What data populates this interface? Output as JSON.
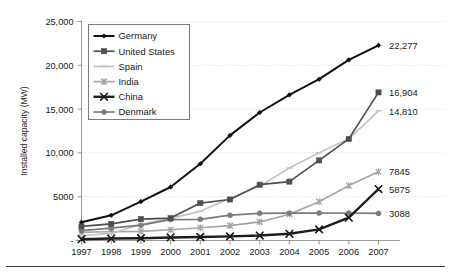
{
  "chart_data": {
    "type": "line",
    "title": "",
    "xlabel": "",
    "ylabel": "Installed capacity (MW)",
    "x": [
      1997,
      1998,
      1999,
      2000,
      2001,
      2002,
      2003,
      2004,
      2005,
      2006,
      2007
    ],
    "categories": [
      "1997",
      "1998",
      "1999",
      "2000",
      "2001",
      "2002",
      "2003",
      "2004",
      "2005",
      "2006",
      "2007"
    ],
    "xlim": [
      1997,
      2007
    ],
    "ylim": [
      0,
      25000
    ],
    "yticks": [
      0,
      5000,
      10000,
      15000,
      20000,
      25000
    ],
    "ytick_labels": [
      "-",
      "5000",
      "10,000",
      "15,000",
      "20,000",
      "25,000"
    ],
    "grid": true,
    "legend_position": "upper-left-inside",
    "series": [
      {
        "name": "Germany",
        "color": "#101010",
        "marker": "diamond",
        "width": 2.0,
        "values": [
          2081,
          2875,
          4442,
          6113,
          8754,
          11994,
          14609,
          16629,
          18415,
          20622,
          22277
        ],
        "end_label": "22,277"
      },
      {
        "name": "United States",
        "color": "#4f4f4f",
        "marker": "square",
        "width": 1.7,
        "values": [
          1611,
          1890,
          2445,
          2555,
          4275,
          4685,
          6374,
          6725,
          9149,
          11603,
          16904
        ],
        "end_label": "16,904"
      },
      {
        "name": "Spain",
        "color": "#c3c3c3",
        "marker": "dash",
        "width": 1.7,
        "values": [
          512,
          834,
          1812,
          2535,
          3337,
          4825,
          6203,
          8263,
          10028,
          11615,
          14810
        ],
        "end_label": "14,810"
      },
      {
        "name": "India",
        "color": "#a3a3a3",
        "marker": "asterisk",
        "width": 1.6,
        "values": [
          940,
          992,
          1035,
          1220,
          1456,
          1702,
          2125,
          3000,
          4430,
          6270,
          7845
        ],
        "end_label": "7845"
      },
      {
        "name": "China",
        "color": "#1c1c1c",
        "marker": "cross",
        "width": 2.4,
        "values": [
          146,
          224,
          268,
          346,
          402,
          468,
          567,
          764,
          1266,
          2604,
          5875
        ],
        "end_label": "5875"
      },
      {
        "name": "Denmark",
        "color": "#7a7a7a",
        "marker": "circle",
        "width": 1.7,
        "values": [
          1116,
          1420,
          1742,
          2390,
          2417,
          2889,
          3110,
          3118,
          3128,
          3136,
          3088
        ],
        "end_label": "3088"
      }
    ]
  },
  "legend": {
    "items": [
      {
        "label": "Germany"
      },
      {
        "label": "United States"
      },
      {
        "label": "Spain"
      },
      {
        "label": "India"
      },
      {
        "label": "China"
      },
      {
        "label": "Denmark"
      }
    ]
  }
}
